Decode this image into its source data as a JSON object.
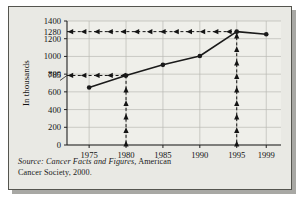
{
  "figure": {
    "source_label": "Source:",
    "source_title": " Cancer Facts and Figures,",
    "source_rest": " American",
    "source_line2": "Cancer Society, 2000.",
    "background_color": "#e9e9e4",
    "border_color": "#55554f",
    "shadow_color": "#a8a8a4",
    "line_color": "#1a1a1a",
    "grid_color": "#b9b9b3"
  },
  "chart_data": {
    "type": "line",
    "title": "",
    "xlabel": "",
    "ylabel": "In thousands",
    "x": [
      1975,
      1980,
      1985,
      1990,
      1995,
      1999
    ],
    "values": [
      650,
      785,
      905,
      1005,
      1280,
      1250
    ],
    "xtick_labels": [
      "1975",
      "1980",
      "1985",
      "1990",
      "1995",
      "1999"
    ],
    "ytick_labels": [
      "0",
      "200",
      "400",
      "600",
      "785",
      "800",
      "1000",
      "1200",
      "1280",
      "1400"
    ],
    "ytick_values": [
      0,
      200,
      400,
      600,
      785,
      800,
      1000,
      1200,
      1280,
      1400
    ],
    "gridline_values": [
      0,
      200,
      400,
      600,
      800,
      1000,
      1200,
      1400
    ],
    "xlim": [
      1972,
      2001
    ],
    "ylim": [
      0,
      1400
    ],
    "grid": true,
    "legend": "none",
    "annotations": [
      {
        "name": "guide-1280",
        "type": "horizontal-dashed-arrow",
        "y_value": 1280,
        "from_x": 1995,
        "to_x": 1972,
        "direction": "left",
        "label": "1280"
      },
      {
        "name": "guide-785",
        "type": "horizontal-dashed-arrow",
        "y_value": 785,
        "from_x": 1980,
        "to_x": 1972,
        "direction": "left",
        "label": "785"
      },
      {
        "name": "guide-1980",
        "type": "vertical-dashed-arrow",
        "x_value": 1980,
        "from_y": 0,
        "to_y": 785,
        "direction": "up",
        "label": "1980"
      },
      {
        "name": "guide-1995",
        "type": "vertical-dashed-arrow",
        "x_value": 1995,
        "from_y": 0,
        "to_y": 1280,
        "direction": "up",
        "label": "1995"
      }
    ]
  }
}
